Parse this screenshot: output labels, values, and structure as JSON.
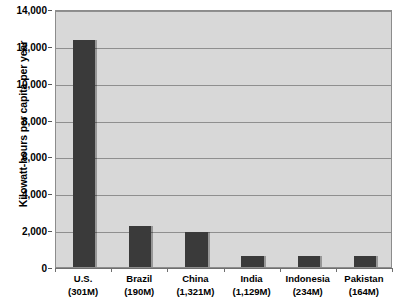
{
  "chart_data": {
    "type": "bar",
    "title": "",
    "subtitle": "",
    "xlabel": "",
    "ylabel": "Kilowatt-hours per capita per year",
    "ylim": [
      0,
      14000
    ],
    "ytick_step": 2000,
    "grid": true,
    "legend": "none",
    "bar_color": "#3a3a3a",
    "plot_background": "#d8d8d8",
    "gridline_color": "#8f8f8f",
    "axis_color": "#6f6f6f",
    "categories": [
      "U.S.",
      "Brazil",
      "China",
      "India",
      "Indonesia",
      "Pakistan"
    ],
    "category_populations": [
      "(301M)",
      "(190M)",
      "(1,321M)",
      "(1,129M)",
      "(234M)",
      "(164M)"
    ],
    "values": [
      12300,
      2200,
      1900,
      600,
      600,
      620
    ],
    "ytick_labels": [
      "14,000",
      "12,000",
      "10,000",
      "8,000",
      "6,000",
      "4,000",
      "2,000",
      "0"
    ],
    "ytick_values": [
      14000,
      12000,
      10000,
      8000,
      6000,
      4000,
      2000,
      0
    ]
  }
}
